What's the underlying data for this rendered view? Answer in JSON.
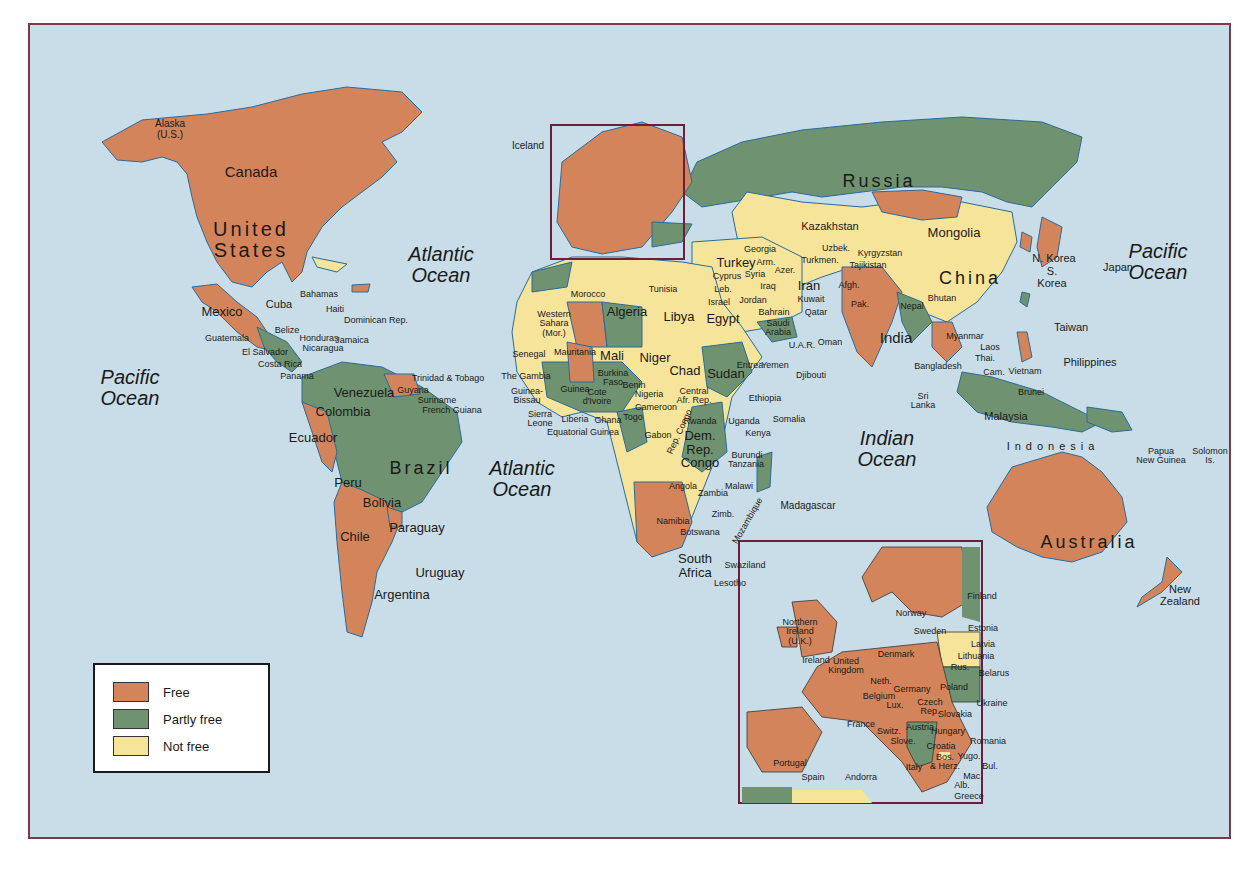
{
  "map": {
    "title_hidden": "World freedom status map",
    "colors": {
      "free": "#d4845a",
      "partly_free": "#6f9370",
      "not_free": "#f6e49a",
      "water": "#c9dde8",
      "border": "#7a3a4a"
    },
    "legend": [
      {
        "key": "free",
        "label": "Free",
        "color": "#d4845a"
      },
      {
        "key": "partly_free",
        "label": "Partly free",
        "color": "#6f9370"
      },
      {
        "key": "not_free",
        "label": "Not free",
        "color": "#f6e49a"
      }
    ],
    "oceans": {
      "atlantic_north": "Atlantic\nOcean",
      "atlantic_south": "Atlantic\nOcean",
      "pacific_east": "Pacific\nOcean",
      "pacific_west": "Pacific\nOcean",
      "indian": "Indian\nOcean"
    },
    "labels": {
      "alaska": "Alaska\n(U.S.)",
      "canada": "Canada",
      "united_states": "United\nStates",
      "iceland": "Iceland",
      "mexico": "Mexico",
      "cuba": "Cuba",
      "bahamas": "Bahamas",
      "haiti": "Haiti",
      "dominican_rep": "Dominican Rep.",
      "belize": "Belize",
      "guatemala": "Guatemala",
      "honduras": "Honduras",
      "jamaica": "Jamaica",
      "el_salvador": "El Salvador",
      "nicaragua": "Nicaragua",
      "costa_rica": "Costa Rica",
      "panama": "Panama",
      "trinidad": "Trinidad & Tobago",
      "guyana": "Guyana",
      "suriname": "Suriname",
      "french_guiana": "French Guiana",
      "venezuela": "Venezuela",
      "colombia": "Colombia",
      "ecuador": "Ecuador",
      "brazil": "Brazil",
      "peru": "Peru",
      "bolivia": "Bolivia",
      "paraguay": "Paraguay",
      "chile": "Chile",
      "uruguay": "Uruguay",
      "argentina": "Argentina",
      "russia": "Russia",
      "kazakhstan": "Kazakhstan",
      "mongolia": "Mongolia",
      "china": "China",
      "n_korea": "N. Korea",
      "s_korea": "S.\nKorea",
      "japan": "Japan",
      "taiwan": "Taiwan",
      "philippines": "Philippines",
      "georgia": "Georgia",
      "armenia": "Arm.",
      "azer": "Azer.",
      "turkey": "Turkey",
      "uzbek": "Uzbek.",
      "kyrgyzstan": "Kyrgyzstan",
      "turkmen": "Turkmen.",
      "tajikistan": "Tajikistan",
      "cyprus": "Cyprus",
      "syria": "Syria",
      "leb": "Leb.",
      "iraq": "Iraq",
      "iran": "Iran",
      "afgh": "Afgh.",
      "israel": "Israel",
      "jordan": "Jordan",
      "kuwait": "Kuwait",
      "bahrain": "Bahrain",
      "qatar": "Qatar",
      "saudi_arabia": "Saudi\nArabia",
      "uar": "U.A.R.",
      "oman": "Oman",
      "pak": "Pak.",
      "nepal": "Nepal",
      "bhutan": "Bhutan",
      "india": "India",
      "bangladesh": "Bangladesh",
      "myanmar": "Myanmar",
      "laos": "Laos",
      "thai": "Thai.",
      "cam": "Cam.",
      "vietnam": "Vietnam",
      "sri_lanka": "Sri\nLanka",
      "brunei": "Brunei",
      "malaysia": "Malaysia",
      "indonesia": "Indonesia",
      "papua": "Papua\nNew Guinea",
      "solomon": "Solomon\nIs.",
      "fiji": "Fiji",
      "australia": "Australia",
      "new_zealand": "New\nZealand",
      "morocco": "Morocco",
      "tunisia": "Tunisia",
      "western_sahara": "Western\nSahara\n(Mor.)",
      "algeria": "Algeria",
      "libya": "Libya",
      "egypt": "Egypt",
      "mauritania": "Mauritania",
      "mali": "Mali",
      "niger": "Niger",
      "senegal": "Senegal",
      "the_gambia": "The Gambia",
      "guinea_bissau": "Guinea-\nBissau",
      "guinea": "Guinea",
      "burkina_faso": "Burkina\nFaso",
      "benin": "Benin",
      "cote_divoire": "Cote\nd'Ivoire",
      "nigeria": "Nigeria",
      "sierra_leone": "Sierra\nLeone",
      "liberia": "Liberia",
      "ghana": "Ghana",
      "togo": "Togo",
      "cameroon": "Cameroon",
      "equatorial_guinea": "Equatorial Guinea",
      "gabon": "Gabon",
      "rep_congo": "Rep. Congo",
      "chad": "Chad",
      "sudan": "Sudan",
      "central_afr_rep": "Central\nAfr. Rep.",
      "eritrea": "Eritrea",
      "yemen": "Yemen",
      "djibouti": "Djibouti",
      "ethiopia": "Ethiopia",
      "somalia": "Somalia",
      "rwanda": "Rwanda",
      "uganda": "Uganda",
      "kenya": "Kenya",
      "dem_rep_congo": "Dem.\nRep.\nCongo",
      "burundi": "Burundi",
      "tanzania": "Tanzania",
      "angola": "Angola",
      "zambia": "Zambia",
      "malawi": "Malawi",
      "mozambique": "Mozambique",
      "madagascar": "Madagascar",
      "namibia": "Namibia",
      "zimb": "Zimb.",
      "botswana": "Botswana",
      "south_africa": "South\nAfrica",
      "swaziland": "Swaziland",
      "lesotho": "Lesotho"
    },
    "inset": {
      "labels": {
        "northern_ireland": "Northern\nIreland\n(U.K.)",
        "ireland": "Ireland",
        "united_kingdom": "United\nKingdom",
        "norway": "Norway",
        "sweden": "Sweden",
        "finland": "Finland",
        "estonia": "Estonia",
        "latvia": "Latvia",
        "lithuania": "Lithuania",
        "rus": "Rus.",
        "belarus": "Belarus",
        "denmark": "Denmark",
        "neth": "Neth.",
        "belgium": "Belgium",
        "lux": "Lux.",
        "germany": "Germany",
        "poland": "Poland",
        "czech_rep": "Czech\nRep.",
        "slovakia": "Slovakia",
        "ukraine": "Ukraine",
        "france": "France",
        "switz": "Switz.",
        "austria": "Austria",
        "hungary": "Hungary",
        "slove": "Slove.",
        "croatia": "Croatia",
        "bos_herz": "Bos.\n& Herz.",
        "yugo": "Yugo.",
        "romania": "Romania",
        "bul": "Bul.",
        "mac": "Mac.",
        "alb": "Alb.",
        "greece": "Greece",
        "italy": "Italy",
        "portugal": "Portugal",
        "spain": "Spain",
        "andorra": "Andorra"
      }
    }
  }
}
